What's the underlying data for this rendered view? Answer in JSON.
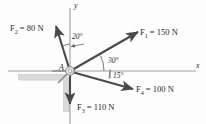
{
  "figure": {
    "type": "force-vector-diagram",
    "origin_point_label": "A",
    "axes": {
      "x_label": "x",
      "y_label": "y"
    },
    "colors": {
      "vector": "#4a4a4a",
      "axis": "#9a9a9a",
      "text": "#2b2b2b",
      "shadow": "#c9c9c9",
      "hub": "#d8d8d8",
      "background": "#ffffff"
    },
    "forces": [
      {
        "id": "F1",
        "label_prefix": "F",
        "subscript": "1",
        "equals": "=",
        "magnitude": "150",
        "unit": "N",
        "label_full": "F1 = 150 N",
        "angle_deg_from_x_axis": 30,
        "direction": "up-right"
      },
      {
        "id": "F2",
        "label_prefix": "F",
        "subscript": "2",
        "equals": "=",
        "magnitude": "80",
        "unit": "N",
        "label_full": "F2 = 80 N",
        "angle_deg_from_y_axis": 20,
        "direction": "up-left"
      },
      {
        "id": "F3",
        "label_prefix": "F",
        "subscript": "3",
        "equals": "=",
        "magnitude": "110",
        "unit": "N",
        "label_full": "F3 = 110 N",
        "angle_deg_from_x_axis": -90,
        "direction": "down"
      },
      {
        "id": "F4",
        "label_prefix": "F",
        "subscript": "4",
        "equals": "=",
        "magnitude": "100",
        "unit": "N",
        "label_full": "F4 = 100 N",
        "angle_deg_from_x_axis": -15,
        "direction": "down-right"
      }
    ],
    "angles": [
      {
        "id": "angle-20",
        "value": "20",
        "symbol": "°",
        "text": "20°",
        "between": "F2 and y-axis"
      },
      {
        "id": "angle-30",
        "value": "30",
        "symbol": "°",
        "text": "30°",
        "between": "F1 and x-axis"
      },
      {
        "id": "angle-15",
        "value": "15",
        "symbol": "°",
        "text": "15°",
        "between": "F4 and x-axis"
      }
    ]
  }
}
